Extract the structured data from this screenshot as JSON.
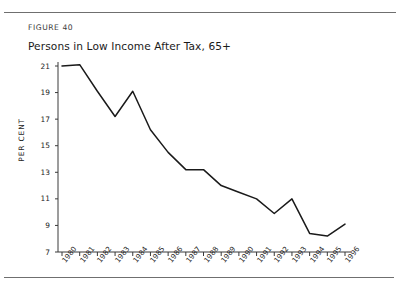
{
  "document": {
    "clipped_top_text": "­  ­ ­",
    "figure_label": "FIGURE 40",
    "figure_title": "Persons in Low Income After Tax, 65+"
  },
  "chart_data": {
    "type": "line",
    "title": "Persons in Low Income After Tax, 65+",
    "figure_number": "FIGURE 40",
    "xlabel": "",
    "ylabel": "PER CENT",
    "categories": [
      "1980",
      "1981",
      "1982",
      "1983",
      "1984",
      "1985",
      "1986",
      "1987",
      "1988",
      "1989",
      "1990",
      "1991",
      "1992",
      "1993",
      "1994",
      "1995",
      "1996"
    ],
    "values": [
      21.0,
      21.1,
      19.1,
      17.2,
      19.1,
      16.2,
      14.5,
      13.2,
      13.2,
      12.0,
      11.5,
      11.0,
      9.9,
      11.0,
      8.4,
      8.2,
      9.1
    ],
    "series": [
      {
        "name": "Persons in Low Income After Tax, 65+",
        "values": [
          21.0,
          21.1,
          19.1,
          17.2,
          19.1,
          16.2,
          14.5,
          13.2,
          13.2,
          12.0,
          11.5,
          11.0,
          9.9,
          11.0,
          8.4,
          8.2,
          9.1
        ],
        "color": "#1a1a1a"
      }
    ],
    "ylim": [
      7,
      21
    ],
    "yticks": [
      7,
      9,
      11,
      13,
      15,
      17,
      19,
      21
    ],
    "ytick_labels": [
      "7",
      "9",
      "11",
      "13",
      "15",
      "17",
      "19",
      "21"
    ],
    "xtick_labels": [
      "1980",
      "1981",
      "1982",
      "1983",
      "1984",
      "1985",
      "1986",
      "1987",
      "1988",
      "1989",
      "1990",
      "1991",
      "1992",
      "1993",
      "1994",
      "1995",
      "1996"
    ],
    "grid": false,
    "legend": false,
    "legend_position": "none",
    "line_color": "#1a1a1a",
    "axis_color": "#3a3a3a"
  }
}
